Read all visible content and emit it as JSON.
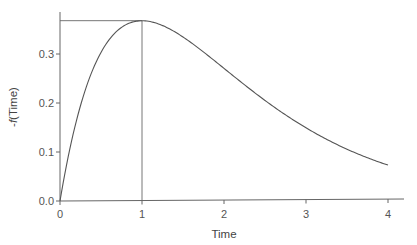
{
  "chart_data": {
    "type": "line",
    "title": "",
    "xlabel": "Time",
    "ylabel_prefix": "-",
    "ylabel_func": "f",
    "ylabel_suffix": "(Time)",
    "xlim": [
      0,
      4.2
    ],
    "ylim": [
      0,
      0.39
    ],
    "xticks": [
      0,
      1,
      2,
      3,
      4
    ],
    "xtick_labels": [
      "0",
      "1",
      "2",
      "3",
      "4"
    ],
    "yticks": [
      0.0,
      0.1,
      0.2,
      0.3
    ],
    "ytick_labels": [
      "0.0",
      "0.1",
      "0.2",
      "0.3"
    ],
    "grid": false,
    "legend": null,
    "series": [
      {
        "name": "-f(Time)",
        "x": [
          0,
          0.1,
          0.2,
          0.3,
          0.4,
          0.5,
          0.6,
          0.7,
          0.8,
          0.9,
          1.0,
          1.25,
          1.5,
          1.75,
          2.0,
          2.25,
          2.5,
          2.75,
          3.0,
          3.25,
          3.5,
          3.75,
          4.0
        ],
        "y": [
          0.0,
          0.09,
          0.164,
          0.222,
          0.268,
          0.303,
          0.329,
          0.348,
          0.359,
          0.366,
          0.368,
          0.358,
          0.335,
          0.304,
          0.271,
          0.237,
          0.205,
          0.176,
          0.149,
          0.126,
          0.106,
          0.088,
          0.073
        ]
      }
    ],
    "annotations": [
      {
        "type": "hline",
        "y": 0.368,
        "from_x": 0,
        "to_x": 1,
        "label": "peak value"
      },
      {
        "type": "vline",
        "x": 1,
        "from_y": 0,
        "to_y": 0.368,
        "label": "peak time"
      }
    ]
  },
  "colors": {
    "line": "#555555",
    "axis": "#666666",
    "ref_line": "#777777",
    "text": "#555555"
  }
}
